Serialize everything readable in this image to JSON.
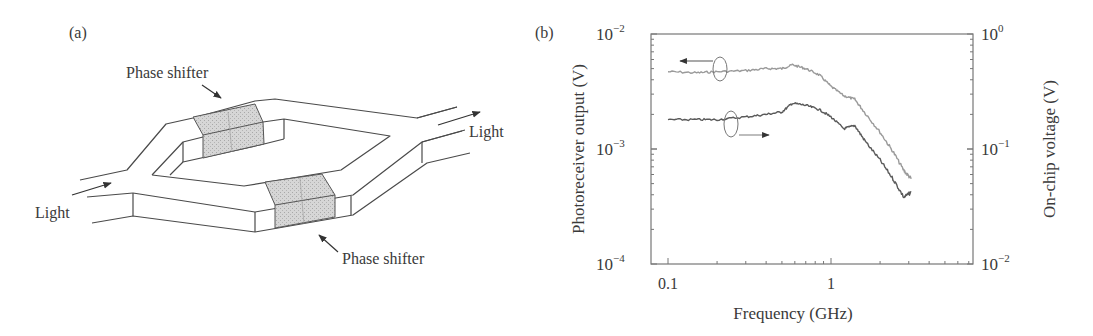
{
  "panel_a": {
    "label": "(a)",
    "phase_shifter_top": "Phase shifter",
    "phase_shifter_bottom": "Phase shifter",
    "light_in": "Light",
    "light_out": "Light"
  },
  "panel_b": {
    "label": "(b)",
    "xlabel": "Frequency (GHz)",
    "ylabel_left": "Photoreceiver output (V)",
    "ylabel_right": "On-chip voltage (V)",
    "x_ticks": [
      "0.1",
      "1"
    ],
    "y_left_ticks": [
      {
        "base": "10",
        "exp": "−2"
      },
      {
        "base": "10",
        "exp": "−3"
      },
      {
        "base": "10",
        "exp": "−4"
      }
    ],
    "y_right_ticks": [
      {
        "base": "10",
        "exp": "0"
      },
      {
        "base": "10",
        "exp": "−1"
      },
      {
        "base": "10",
        "exp": "−2"
      }
    ],
    "colors": {
      "photoreceiver": "#9a9a9a",
      "onchip": "#5a5a5a",
      "axes": "#777777"
    }
  },
  "chart_data": {
    "type": "line",
    "title": "",
    "xlabel": "Frequency (GHz)",
    "ylabel": "Photoreceiver output (V)",
    "ylabel_right": "On-chip voltage (V)",
    "xscale": "log",
    "yscale": "log",
    "xlim": [
      0.08,
      3.5
    ],
    "ylim": [
      0.0001,
      0.01
    ],
    "ylim_right": [
      0.01,
      1
    ],
    "x_ticks": [
      0.1,
      1
    ],
    "y_ticks": [
      0.0001,
      0.001,
      0.01
    ],
    "y_ticks_right": [
      0.01,
      0.1,
      1
    ],
    "grid": false,
    "legend": "none (axis assignment shown by circled arrows)",
    "x": [
      0.1,
      0.15,
      0.2,
      0.3,
      0.4,
      0.5,
      0.58,
      0.7,
      0.85,
      1.0,
      1.2,
      1.4,
      1.6,
      2.0,
      2.4,
      2.8,
      3.1
    ],
    "series": [
      {
        "name": "Photoreceiver output (left axis, V)",
        "axis": "left",
        "color": "#9a9a9a",
        "values": [
          0.0047,
          0.0046,
          0.0047,
          0.0048,
          0.005,
          0.005,
          0.0054,
          0.005,
          0.0044,
          0.0035,
          0.0029,
          0.0027,
          0.0021,
          0.0014,
          0.00095,
          0.00065,
          0.00055
        ]
      },
      {
        "name": "On-chip voltage (right axis, V)",
        "axis": "right",
        "color": "#5a5a5a",
        "values": [
          0.18,
          0.18,
          0.18,
          0.19,
          0.2,
          0.21,
          0.25,
          0.24,
          0.22,
          0.19,
          0.15,
          0.16,
          0.12,
          0.08,
          0.055,
          0.038,
          0.042
        ]
      }
    ]
  }
}
